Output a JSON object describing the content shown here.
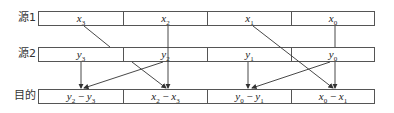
{
  "rows": [
    {
      "label": "源1",
      "cells": [
        {
          "base": "x",
          "sub": "3"
        },
        {
          "base": "x",
          "sub": "2"
        },
        {
          "base": "x",
          "sub": "1"
        },
        {
          "base": "x",
          "sub": "0"
        }
      ]
    },
    {
      "label": "源2",
      "cells": [
        {
          "base": "y",
          "sub": "3"
        },
        {
          "base": "y",
          "sub": "2"
        },
        {
          "base": "y",
          "sub": "1"
        },
        {
          "base": "y",
          "sub": "0"
        }
      ]
    },
    {
      "label": "目的",
      "cells": [
        {
          "a": "y",
          "a_sub": "2",
          "op": "−",
          "b": "y",
          "b_sub": "3"
        },
        {
          "a": "x",
          "a_sub": "2",
          "op": "−",
          "b": "x",
          "b_sub": "3"
        },
        {
          "a": "y",
          "a_sub": "0",
          "op": "−",
          "b": "y",
          "b_sub": "1"
        },
        {
          "a": "x",
          "a_sub": "0",
          "op": "−",
          "b": "x",
          "b_sub": "1"
        }
      ]
    }
  ],
  "colors": {
    "line": "#333333",
    "border": "#555555"
  }
}
